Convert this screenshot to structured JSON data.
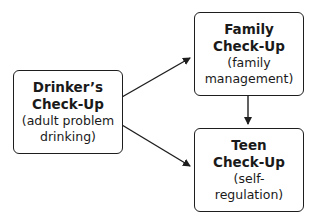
{
  "nodes": [
    {
      "id": "drinker",
      "title_lines": [
        "Drinker’s",
        "Check-Up"
      ],
      "sub_lines": [
        "(adult problem",
        "drinking)"
      ]
    },
    {
      "id": "family",
      "title_lines": [
        "Family",
        "Check-Up"
      ],
      "sub_lines": [
        "(family",
        "management)"
      ]
    },
    {
      "id": "teen",
      "title_lines": [
        "Teen",
        "Check-Up"
      ],
      "sub_lines": [
        "(self-",
        "regulation)"
      ]
    }
  ],
  "edges": [
    {
      "from": "drinker",
      "to": "family"
    },
    {
      "from": "drinker",
      "to": "teen"
    },
    {
      "from": "family",
      "to": "teen"
    }
  ]
}
